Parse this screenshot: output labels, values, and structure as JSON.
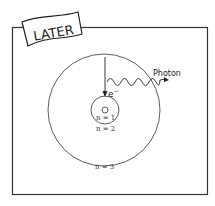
{
  "banner": {
    "label": "LATER"
  },
  "diagram": {
    "electron_label": "e",
    "electron_charge": "−",
    "photon_label": "Photon",
    "levels": [
      {
        "label": "n = 1"
      },
      {
        "label": "n = 2"
      },
      {
        "label": "n = 3"
      }
    ]
  },
  "colors": {
    "line": "#222222",
    "frame": "#333333",
    "background": "#ffffff"
  }
}
